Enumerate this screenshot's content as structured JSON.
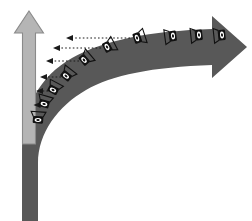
{
  "figure": {
    "title_fragment": "",
    "type": "asymptotic-curve-diagram",
    "background_color": "#ffffff"
  },
  "colors": {
    "curve_dark_gray": "#585858",
    "axis_light_gray": "#b5b5b5",
    "axis_outline_gray": "#8a8a8a",
    "dashed_arrow_black": "#1a1a1a",
    "eye_icon_black": "#111111",
    "eye_icon_white": "#ffffff"
  },
  "vertical_arrow": {
    "name": "vertical-gray-arrow",
    "direction": "up",
    "x_center": 29,
    "tip_y": 11,
    "base_y": 144,
    "shaft_width": 13,
    "head_width": 29,
    "head_height": 22,
    "fill": "#b5b5b5",
    "stroke": "#8a8a8a"
  },
  "curve_arrow": {
    "name": "curved-dark-arrow",
    "direction": "right",
    "description": "thick dark gray curve rising from bottom-left vertical trunk, bending to horizontal and ending in right-pointing arrowhead",
    "trunk_x_left": 22,
    "trunk_x_right": 38,
    "trunk_bottom_y": 221,
    "tip_x": 247,
    "tip_y": 47,
    "head_half_height": 19,
    "fill": "#585858"
  },
  "eye_markers": [
    {
      "id": "eye-1",
      "x": 137,
      "y": 38,
      "rotation": -18,
      "order": 7
    },
    {
      "id": "eye-2",
      "x": 107,
      "y": 47,
      "rotation": -28,
      "order": 6
    },
    {
      "id": "eye-3",
      "x": 84,
      "y": 60,
      "rotation": -40,
      "order": 5
    },
    {
      "id": "eye-4",
      "x": 66,
      "y": 76,
      "rotation": -52,
      "order": 4
    },
    {
      "id": "eye-5",
      "x": 53,
      "y": 90,
      "rotation": -62,
      "order": 3
    },
    {
      "id": "eye-6",
      "x": 44,
      "y": 104,
      "rotation": -74,
      "order": 2
    },
    {
      "id": "eye-7",
      "x": 38,
      "y": 120,
      "rotation": -86,
      "order": 1
    },
    {
      "id": "eye-8",
      "x": 173,
      "y": 36,
      "rotation": -8,
      "order": 8
    },
    {
      "id": "eye-9",
      "x": 199,
      "y": 35,
      "rotation": -6,
      "order": 9
    },
    {
      "id": "eye-10",
      "x": 222,
      "y": 35,
      "rotation": -6,
      "order": 10
    }
  ],
  "dashed_arrows": [
    {
      "id": "dash-1",
      "y": 38,
      "x_start": 130,
      "x_end": 66,
      "length": 64
    },
    {
      "id": "dash-2",
      "y": 48,
      "x_start": 101,
      "x_end": 53,
      "length": 48
    },
    {
      "id": "dash-3",
      "y": 61,
      "x_start": 79,
      "x_end": 46,
      "length": 33
    },
    {
      "id": "dash-4",
      "y": 77,
      "x_start": 61,
      "x_end": 40,
      "length": 21
    },
    {
      "id": "dash-5",
      "y": 91,
      "x_start": 48,
      "x_end": 36,
      "length": 12
    },
    {
      "id": "dash-6",
      "y": 105,
      "x_start": 40,
      "x_end": 34,
      "length": 6
    }
  ],
  "labels": {
    "top_clipped_text": ""
  }
}
